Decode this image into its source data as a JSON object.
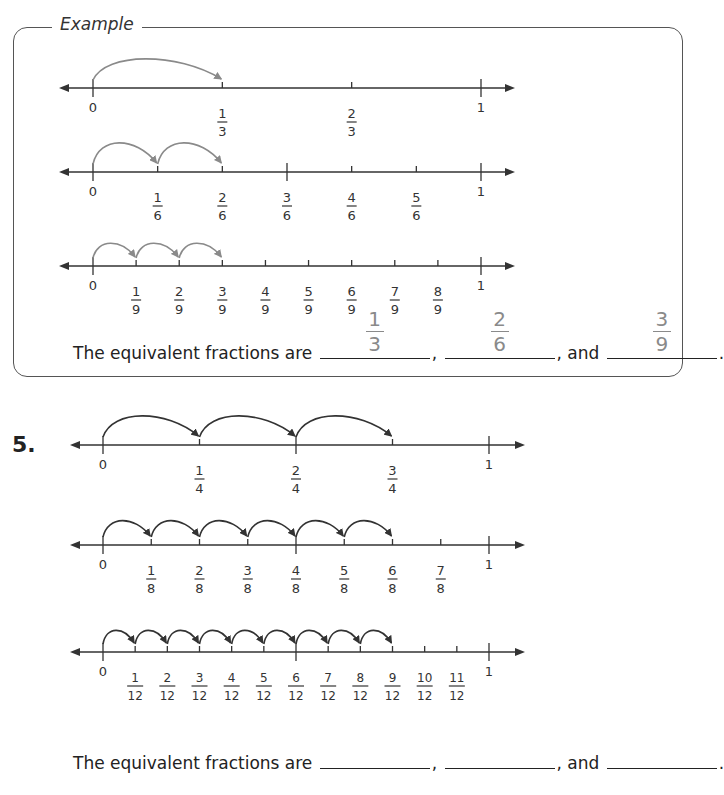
{
  "example": {
    "label": "Example",
    "number_lines": [
      {
        "denominator": 3,
        "ticks": [
          "0",
          "1/3",
          "2/3",
          "1"
        ],
        "jumps": 1,
        "color": "#8a8a8a"
      },
      {
        "denominator": 6,
        "ticks": [
          "0",
          "1/6",
          "2/6",
          "3/6",
          "4/6",
          "5/6",
          "1"
        ],
        "jumps": 2,
        "color": "#8a8a8a"
      },
      {
        "denominator": 9,
        "ticks": [
          "0",
          "1/9",
          "2/9",
          "3/9",
          "4/9",
          "5/9",
          "6/9",
          "7/9",
          "8/9",
          "1"
        ],
        "jumps": 3,
        "color": "#8a8a8a"
      }
    ],
    "sentence": {
      "prefix": "The equivalent fractions are",
      "sep1": ",",
      "sep2": ", and",
      "end": ".",
      "answers": [
        {
          "num": "1",
          "den": "3"
        },
        {
          "num": "2",
          "den": "6"
        },
        {
          "num": "3",
          "den": "9"
        }
      ]
    }
  },
  "problem": {
    "number": "5.",
    "number_lines": [
      {
        "denominator": 4,
        "ticks": [
          "0",
          "1/4",
          "2/4",
          "3/4",
          "1"
        ],
        "jumps": 3,
        "color": "#333333"
      },
      {
        "denominator": 8,
        "ticks": [
          "0",
          "1/8",
          "2/8",
          "3/8",
          "4/8",
          "5/8",
          "6/8",
          "7/8",
          "1"
        ],
        "jumps": 6,
        "color": "#333333"
      },
      {
        "denominator": 12,
        "ticks": [
          "0",
          "1/12",
          "2/12",
          "3/12",
          "4/12",
          "5/12",
          "6/12",
          "7/12",
          "8/12",
          "9/12",
          "10/12",
          "11/12",
          "1"
        ],
        "jumps": 9,
        "color": "#333333"
      }
    ],
    "sentence": {
      "prefix": "The equivalent fractions are",
      "sep1": ",",
      "sep2": ", and",
      "end": ".",
      "answers": [
        "",
        "",
        ""
      ]
    }
  }
}
